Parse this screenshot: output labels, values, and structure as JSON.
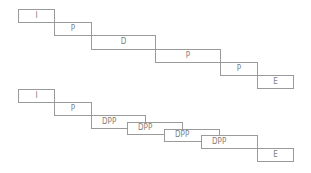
{
  "diagram": {
    "type": "staggered-phase-timeline",
    "rows": [
      {
        "name": "sequential",
        "boxes": [
          {
            "label": "I",
            "x": 18,
            "y": 9,
            "w": 37,
            "h": 14
          },
          {
            "label": "P",
            "x": 54,
            "y": 22,
            "w": 38,
            "h": 14
          },
          {
            "label": "D",
            "x": 91,
            "y": 35,
            "w": 65,
            "h": 15
          },
          {
            "label": "P",
            "x": 155,
            "y": 49,
            "w": 66,
            "h": 14
          },
          {
            "label": "P",
            "x": 220,
            "y": 62,
            "w": 38,
            "h": 14
          },
          {
            "label": "E",
            "x": 257,
            "y": 75,
            "w": 37,
            "h": 14
          }
        ]
      },
      {
        "name": "pipelined",
        "boxes": [
          {
            "label": "I",
            "x": 18,
            "y": 89,
            "w": 37,
            "h": 14
          },
          {
            "label": "P",
            "x": 54,
            "y": 102,
            "w": 38,
            "h": 14
          },
          {
            "label": "DPP",
            "x": 91,
            "y": 115,
            "w": 55,
            "h": 14
          },
          {
            "label": "DPP",
            "x": 127,
            "y": 122,
            "w": 56,
            "h": 13
          },
          {
            "label": "DPP",
            "x": 164,
            "y": 129,
            "w": 56,
            "h": 13
          },
          {
            "label": "DPP",
            "x": 201,
            "y": 135,
            "w": 57,
            "h": 14
          },
          {
            "label": "E",
            "x": 257,
            "y": 148,
            "w": 37,
            "h": 14
          }
        ]
      }
    ]
  },
  "colors": {
    "border": "#9a9a9a",
    "text": "#7f7f7f",
    "background": "#ffffff"
  }
}
